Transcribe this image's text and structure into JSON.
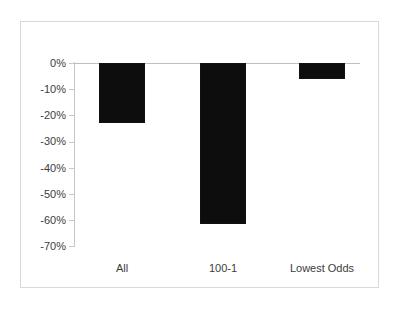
{
  "chart_data": {
    "type": "bar",
    "title": "",
    "subtitle": "",
    "xlabel": "",
    "ylabel": "",
    "categories": [
      "All",
      "100-1",
      "Lowest Odds"
    ],
    "values": [
      -23,
      -61.5,
      -6
    ],
    "series": [
      {
        "name": "Return",
        "values": [
          -23,
          -61.5,
          -6
        ]
      }
    ],
    "ylim": [
      -70,
      0
    ],
    "ytick_values": [
      0,
      -10,
      -20,
      -30,
      -40,
      -50,
      -60,
      -70
    ],
    "ytick_labels": [
      "0%",
      "-10%",
      "-20%",
      "-30%",
      "-40%",
      "-50%",
      "-60%",
      "-70%"
    ],
    "grid": false,
    "legend": null,
    "legend_position": "none",
    "bar_color": "#0d0d0d",
    "axis_color": "#c8c8c8",
    "text_color": "#3c3c3c",
    "border_color": "#d9d9d9",
    "background_color": "#ffffff",
    "orientation": "vertical",
    "value_format": "percent"
  }
}
